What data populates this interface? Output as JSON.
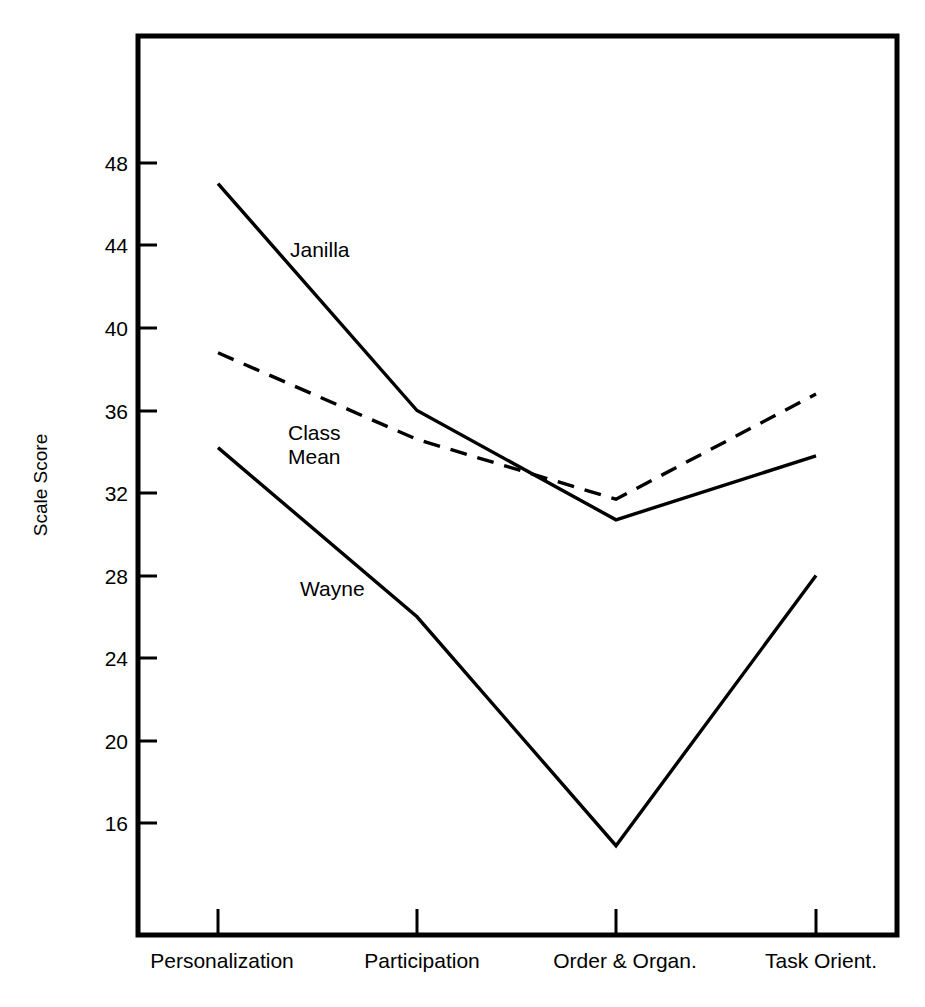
{
  "chart_data": {
    "type": "line",
    "title": "",
    "xlabel": "",
    "ylabel": "Scale Score",
    "categories": [
      "Personalization",
      "Participation",
      "Order & Organ.",
      "Task Orient."
    ],
    "ylim": [
      12,
      50
    ],
    "yticks": [
      16,
      20,
      24,
      28,
      32,
      36,
      40,
      44,
      48
    ],
    "ytick_labels": [
      "16",
      "20",
      "24",
      "28",
      "32",
      "36",
      "40",
      "44",
      "48"
    ],
    "grid": false,
    "legend": "inline-annotations",
    "series": [
      {
        "name": "Janilla",
        "style": "solid",
        "color": "#000000",
        "values": [
          47.0,
          36.0,
          30.7,
          33.8
        ]
      },
      {
        "name": "Class Mean",
        "style": "dashed",
        "color": "#000000",
        "values": [
          38.8,
          34.6,
          31.7,
          36.8
        ]
      },
      {
        "name": "Wayne",
        "style": "solid",
        "color": "#000000",
        "values": [
          34.2,
          26.0,
          14.9,
          28.0
        ]
      }
    ],
    "annotations": [
      {
        "text": "Janilla",
        "x_px": 290,
        "y_px": 257
      },
      {
        "text": "Class",
        "x_px": 288,
        "y_px": 440
      },
      {
        "text": "Mean",
        "x_px": 288,
        "y_px": 464
      },
      {
        "text": "Wayne",
        "x_px": 300,
        "y_px": 596
      }
    ]
  }
}
